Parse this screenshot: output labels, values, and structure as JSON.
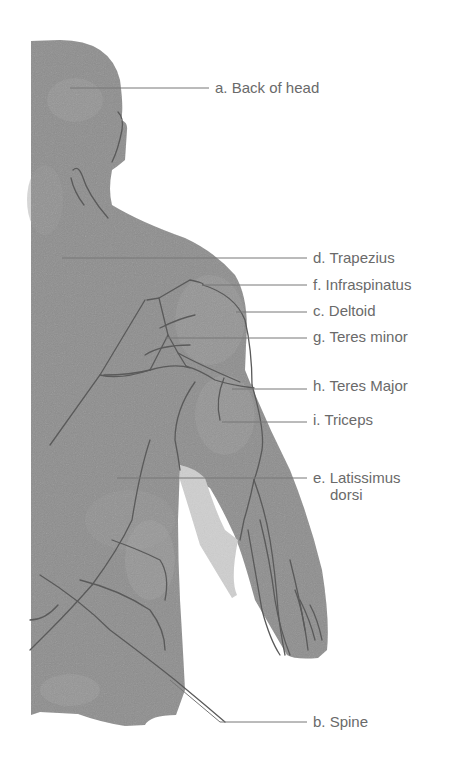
{
  "diagram": {
    "colors": {
      "skin": "#8e8e8e",
      "skin_light": "#9c9c9c",
      "skin_dark": "#7e7e7e",
      "outline": "#5a5a5a",
      "underarm_light": "#cfcfcf",
      "leader_line": "#777777",
      "label_text": "#6a6a6a"
    },
    "labels": [
      {
        "id": "a",
        "text": "a. Back of head",
        "x": 215,
        "y": 51
      },
      {
        "id": "d",
        "text": "d. Trapezius",
        "x": 313,
        "y": 249
      },
      {
        "id": "f",
        "text": "f. Infraspinatus",
        "x": 313,
        "y": 276
      },
      {
        "id": "c",
        "text": "c. Deltoid",
        "x": 313,
        "y": 302
      },
      {
        "id": "g",
        "text": "g. Teres minor",
        "x": 313,
        "y": 328
      },
      {
        "id": "h",
        "text": "h. Teres Major",
        "x": 313,
        "y": 377
      },
      {
        "id": "i",
        "text": "i. Triceps",
        "x": 313,
        "y": 411
      },
      {
        "id": "e",
        "text": "e. Latissimus",
        "text2": "dorsi",
        "x": 313,
        "y": 469
      },
      {
        "id": "b",
        "text": "b. Spine",
        "x": 313,
        "y": 713
      }
    ]
  }
}
